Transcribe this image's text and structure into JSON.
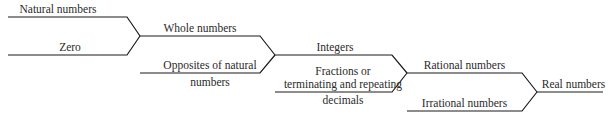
{
  "diagram": {
    "nodes": [
      {
        "id": "natural",
        "label": "Natural numbers"
      },
      {
        "id": "zero",
        "label": "Zero"
      },
      {
        "id": "whole",
        "label": "Whole numbers"
      },
      {
        "id": "opposites",
        "label_line1": "Opposites of natural",
        "label_line2": "numbers"
      },
      {
        "id": "integers",
        "label": "Integers"
      },
      {
        "id": "fractions",
        "label_line1": "Fractions or",
        "label_line2": "terminating and repeating",
        "label_line3": "decimals"
      },
      {
        "id": "rational",
        "label": "Rational numbers"
      },
      {
        "id": "irrational",
        "label": "Irrational numbers"
      },
      {
        "id": "real",
        "label": "Real numbers"
      }
    ],
    "edges": [
      {
        "from": "natural",
        "to": "whole"
      },
      {
        "from": "zero",
        "to": "whole"
      },
      {
        "from": "whole",
        "to": "integers"
      },
      {
        "from": "opposites",
        "to": "integers"
      },
      {
        "from": "integers",
        "to": "rational"
      },
      {
        "from": "fractions",
        "to": "rational"
      },
      {
        "from": "rational",
        "to": "real"
      },
      {
        "from": "irrational",
        "to": "real"
      }
    ],
    "line_color": "#1a1a1a"
  }
}
